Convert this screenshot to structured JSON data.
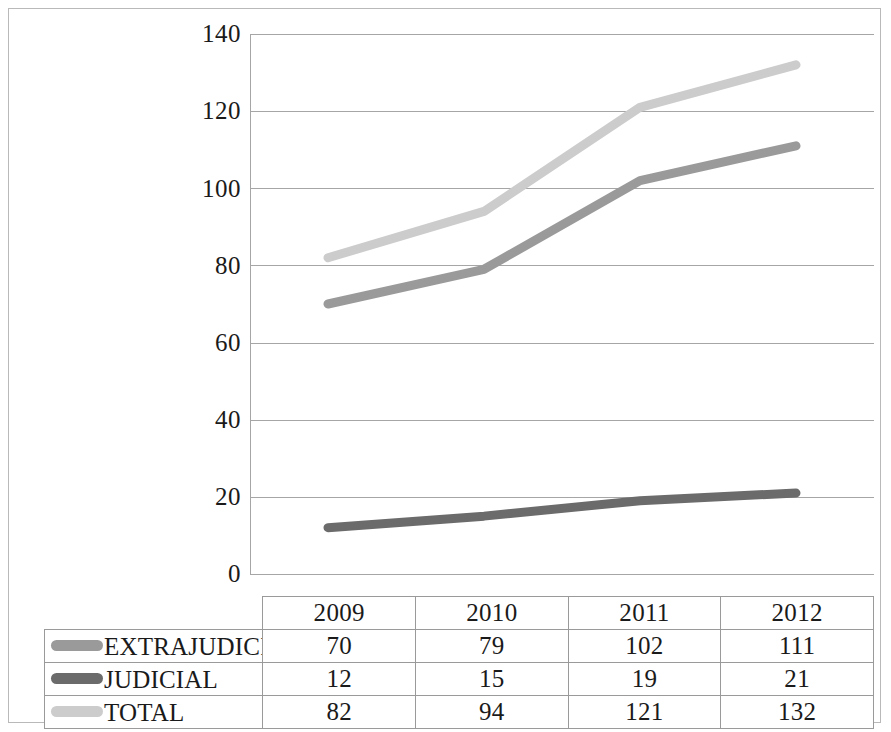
{
  "chart_data": {
    "type": "line",
    "title": "",
    "subtitle": "",
    "xlabel": "",
    "ylabel": "",
    "categories": [
      "2009",
      "2010",
      "2011",
      "2012"
    ],
    "series": [
      {
        "name": "EXTRAJUDICIA",
        "values": [
          70,
          79,
          102,
          111
        ],
        "color": "#9a9a9a"
      },
      {
        "name": "JUDICIAL",
        "values": [
          12,
          15,
          19,
          21
        ],
        "color": "#6b6b6b"
      },
      {
        "name": "TOTAL",
        "values": [
          82,
          94,
          121,
          132
        ],
        "color": "#cccccc"
      }
    ],
    "ylim": [
      0,
      140
    ],
    "ytick_step": 20,
    "yticks": [
      "140",
      "120",
      "100",
      "80",
      "60",
      "40",
      "20",
      "0"
    ],
    "grid": true,
    "legend_position": "data-table-left",
    "has_data_table": true
  },
  "table": {
    "header_row": [
      "",
      "2009",
      "2010",
      "2011",
      "2012"
    ],
    "rows": [
      {
        "label": "EXTRAJUDICIA",
        "swatch_color": "#9a9a9a",
        "cells": [
          "70",
          "79",
          "102",
          "111"
        ]
      },
      {
        "label": "JUDICIAL",
        "swatch_color": "#6b6b6b",
        "cells": [
          "12",
          "15",
          "19",
          "21"
        ]
      },
      {
        "label": "TOTAL",
        "swatch_color": "#cccccc",
        "cells": [
          "82",
          "94",
          "121",
          "132"
        ]
      }
    ]
  },
  "axis": {
    "y_ticks": [
      "140",
      "120",
      "100",
      "80",
      "60",
      "40",
      "20",
      "0"
    ]
  }
}
